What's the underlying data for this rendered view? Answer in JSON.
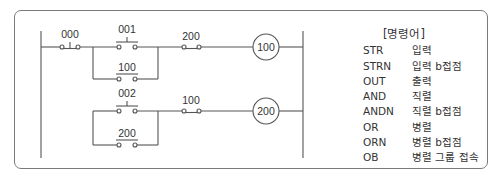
{
  "diagram": {
    "type": "ladder-diagram",
    "rungs": [
      {
        "contacts": [
          {
            "label": "000",
            "type": "b-contact-pushbutton"
          },
          {
            "label": "001",
            "type": "a-contact-pushbutton",
            "parallel_with": "100"
          },
          {
            "label": "100",
            "type": "a-contact"
          },
          {
            "label": "200",
            "type": "b-contact"
          }
        ],
        "coil": "100"
      },
      {
        "contacts": [
          {
            "label": "002",
            "type": "a-contact-pushbutton",
            "parallel_with": "200"
          },
          {
            "label": "200",
            "type": "a-contact"
          },
          {
            "label": "100",
            "type": "b-contact"
          }
        ],
        "coil": "200"
      }
    ],
    "labels": {
      "c000": "000",
      "c001": "001",
      "c100_branch": "100",
      "c200_r1": "200",
      "coil100": "100",
      "c002": "002",
      "c200_branch": "200",
      "c100_r2": "100",
      "coil200": "200"
    }
  },
  "legend": {
    "title": "[명령어]",
    "items": [
      {
        "code": "STR",
        "desc": "입력"
      },
      {
        "code": "STRN",
        "desc": "입력 b접점"
      },
      {
        "code": "OUT",
        "desc": "출력"
      },
      {
        "code": "AND",
        "desc": "직렬"
      },
      {
        "code": "ANDN",
        "desc": "직렬 b접점"
      },
      {
        "code": "OR",
        "desc": "병렬"
      },
      {
        "code": "ORN",
        "desc": "병렬 b접점"
      },
      {
        "code": "OB",
        "desc": "병렬 그룹 접속"
      }
    ]
  }
}
